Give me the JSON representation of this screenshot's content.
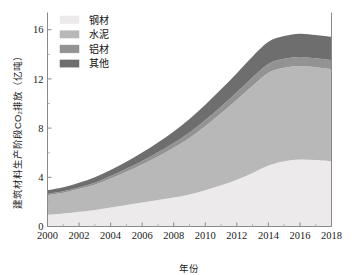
{
  "chart_data": {
    "type": "area",
    "stacked": true,
    "title": "",
    "xlabel": "年份",
    "ylabel": "建筑材料生产阶段CO₂排放（亿吨）",
    "xlim": [
      2000,
      2018
    ],
    "ylim": [
      0,
      17.4
    ],
    "xticks": [
      2000,
      2002,
      2004,
      2006,
      2008,
      2010,
      2012,
      2014,
      2016,
      2018
    ],
    "xtick_labels": [
      "2000",
      "2002",
      "2004",
      "2006",
      "2008",
      "2010",
      "2012",
      "2014",
      "2016",
      "2018"
    ],
    "yticks": [
      0,
      4,
      8,
      12,
      16
    ],
    "ytick_labels": [
      "0",
      "4",
      "8",
      "12",
      "16"
    ],
    "minor_xticks": [
      2001,
      2003,
      2005,
      2007,
      2009,
      2011,
      2013,
      2015,
      2017
    ],
    "minor_yticks": [
      2,
      6,
      10,
      14
    ],
    "grid": false,
    "legend_position": "upper-left",
    "x": [
      2000,
      2001,
      2002,
      2003,
      2004,
      2005,
      2006,
      2007,
      2008,
      2009,
      2010,
      2011,
      2012,
      2013,
      2014,
      2015,
      2016,
      2017,
      2018
    ],
    "series": [
      {
        "name": "钢材",
        "color": "#eceaea",
        "values": [
          0.95,
          1.05,
          1.2,
          1.35,
          1.55,
          1.75,
          1.95,
          2.15,
          2.35,
          2.6,
          2.95,
          3.35,
          3.8,
          4.35,
          4.95,
          5.3,
          5.45,
          5.4,
          5.3
        ]
      },
      {
        "name": "水泥",
        "color": "#b8b8b8",
        "values": [
          1.6,
          1.7,
          1.85,
          2.05,
          2.35,
          2.7,
          3.1,
          3.55,
          4.05,
          4.6,
          5.2,
          5.85,
          6.5,
          7.1,
          7.55,
          7.6,
          7.6,
          7.55,
          7.5
        ]
      },
      {
        "name": "铝材",
        "color": "#939393",
        "values": [
          0.1,
          0.11,
          0.13,
          0.16,
          0.2,
          0.24,
          0.28,
          0.33,
          0.38,
          0.44,
          0.5,
          0.56,
          0.62,
          0.68,
          0.72,
          0.73,
          0.73,
          0.72,
          0.72
        ]
      },
      {
        "name": "其他",
        "color": "#6e6e6e",
        "values": [
          0.3,
          0.33,
          0.38,
          0.44,
          0.5,
          0.58,
          0.68,
          0.8,
          0.95,
          1.1,
          1.25,
          1.4,
          1.55,
          1.7,
          1.8,
          1.85,
          1.9,
          1.9,
          1.9
        ]
      }
    ],
    "totals_note": "",
    "legend_entries": [
      {
        "label": "钢材",
        "color": "#eceaea"
      },
      {
        "label": "水泥",
        "color": "#b8b8b8"
      },
      {
        "label": "铝材",
        "color": "#939393"
      },
      {
        "label": "其他",
        "color": "#6e6e6e"
      }
    ]
  },
  "colors": {
    "axis": "#8a8a8a",
    "text": "#1a1a1a",
    "background": "#ffffff"
  }
}
